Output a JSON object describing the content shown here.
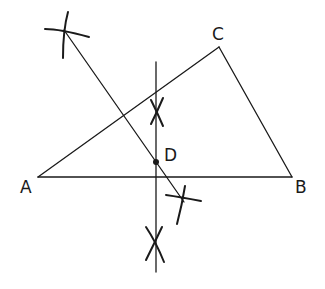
{
  "diagram": {
    "type": "geometric-construction",
    "points": {
      "A": {
        "label": "A",
        "x": 38,
        "y": 177
      },
      "B": {
        "label": "B",
        "x": 292,
        "y": 177
      },
      "C": {
        "label": "C",
        "x": 219,
        "y": 47
      },
      "D": {
        "label": "D",
        "x": 156,
        "y": 162
      }
    },
    "colors": {
      "line": "#1a1a1a",
      "background": "#ffffff"
    }
  }
}
